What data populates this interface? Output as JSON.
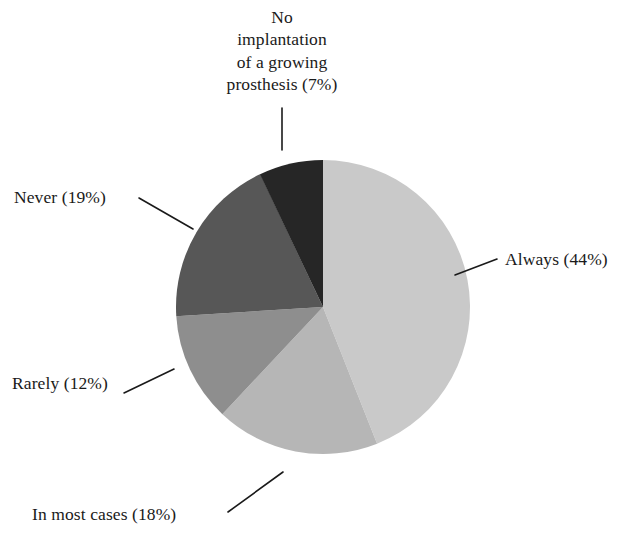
{
  "figure": {
    "background_color": "#ffffff",
    "text_color": "#1a1a1a"
  },
  "chart_data": {
    "type": "pie",
    "title": "",
    "subtitle": "",
    "xlabel": "",
    "ylabel": "",
    "grid": false,
    "legend_position": "none",
    "label_style": "outside-with-leader-lines",
    "start_angle_deg": 0,
    "direction": "clockwise",
    "units": "percent",
    "total": 100,
    "center": {
      "x": 323,
      "y": 307
    },
    "radius": 147,
    "categories": [
      "Always",
      "In most cases",
      "Rarely",
      "Never",
      "No implantation of a growing prosthesis"
    ],
    "values": [
      44,
      18,
      12,
      19,
      7
    ],
    "colors": [
      "#c9c9c9",
      "#b6b6b6",
      "#8e8e8e",
      "#575757",
      "#262626"
    ],
    "slices": [
      {
        "name": "Always",
        "label": "Always (44%)",
        "value": 44,
        "color": "#c9c9c9",
        "start_angle_deg": 0,
        "end_angle_deg": 158.4
      },
      {
        "name": "In most cases",
        "label": "In most cases (18%)",
        "value": 18,
        "color": "#b6b6b6",
        "start_angle_deg": 158.4,
        "end_angle_deg": 223.2
      },
      {
        "name": "Rarely",
        "label": "Rarely (12%)",
        "value": 12,
        "color": "#8e8e8e",
        "start_angle_deg": 223.2,
        "end_angle_deg": 266.4
      },
      {
        "name": "Never",
        "label": "Never (19%)",
        "value": 19,
        "color": "#575757",
        "start_angle_deg": 266.4,
        "end_angle_deg": 334.8
      },
      {
        "name": "No implantation of a growing prosthesis",
        "label": "No implantation of a growing prosthesis (7%)",
        "value": 7,
        "color": "#262626",
        "start_angle_deg": 334.8,
        "end_angle_deg": 360
      }
    ]
  },
  "labels": {
    "no_implantation": {
      "line1": "No",
      "line2": "implantation",
      "line3": "of a growing",
      "line4": "prosthesis (7%)",
      "full": "No implantation of a growing prosthesis (7%)"
    },
    "never": "Never (19%)",
    "rarely": "Rarely (12%)",
    "in_most_cases": "In most cases (18%)",
    "always": "Always (44%)"
  }
}
